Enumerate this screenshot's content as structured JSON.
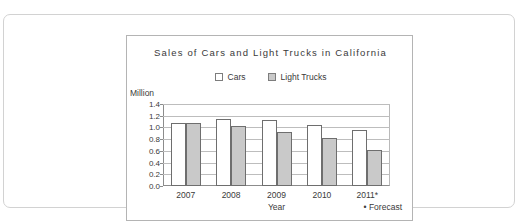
{
  "chart_data": {
    "type": "bar",
    "title": "Sales of Cars and Light Trucks in California",
    "xlabel": "Year",
    "ylabel": "Million",
    "ylim": [
      0.0,
      1.4
    ],
    "ytick_labels": [
      "1.4",
      "1.2",
      "1.0",
      "0.8",
      "0.6",
      "0.4",
      "0.2",
      "0.0"
    ],
    "ytick_values": [
      1.4,
      1.2,
      1.0,
      0.8,
      0.6,
      0.4,
      0.2,
      0.0
    ],
    "grid": true,
    "legend_position": "top-center",
    "categories": [
      "2007",
      "2008",
      "2009",
      "2010",
      "2011*"
    ],
    "series": [
      {
        "name": "Cars",
        "values": [
          1.08,
          1.14,
          1.12,
          1.04,
          0.96
        ],
        "color": "#ffffff"
      },
      {
        "name": "Light Trucks",
        "values": [
          1.07,
          1.02,
          0.92,
          0.82,
          0.61
        ],
        "color": "#c9c9c9"
      }
    ],
    "annotations": [
      "* Forecast"
    ]
  },
  "legend": {
    "cars": "Cars",
    "light_trucks": "Light Trucks"
  },
  "axis": {
    "unit": "Million",
    "x_title": "Year"
  },
  "footnote": {
    "forecast": "• Forecast"
  }
}
